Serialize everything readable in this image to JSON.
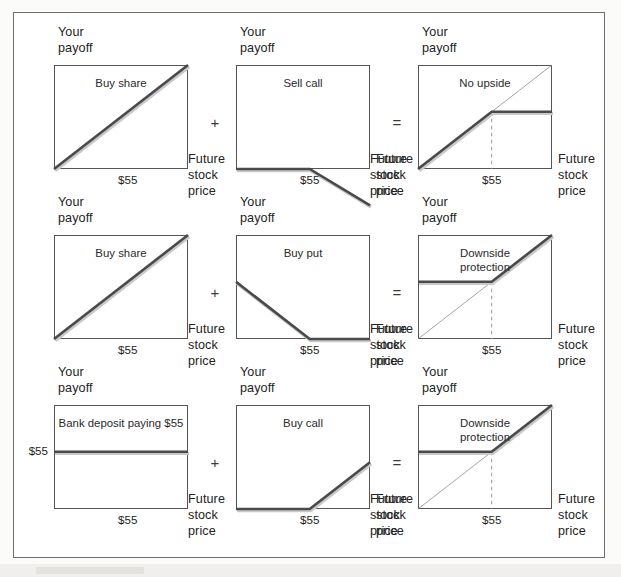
{
  "figure": {
    "strike_label": "$55",
    "y_axis_label": "Your\npayoff",
    "x_axis_label": "Future\nstock\nprice",
    "operator_plus": "+",
    "operator_equals": "="
  },
  "colors": {
    "payoff_line": "#4a4a4a",
    "reference_line": "#8e8e8e",
    "panel_border": "#555555",
    "frame_border": "#6f6f6f",
    "text": "#232323",
    "dashed_guide": "#9a9a9a",
    "page_background": "#fbfbfa",
    "outside_background": "#f2f1ef"
  },
  "chart_data": {
    "type": "line",
    "xlabel": "Future stock price",
    "ylabel": "Your payoff",
    "xlim": [
      0,
      100
    ],
    "ylim": [
      -35,
      100
    ],
    "strike": 55,
    "grid": false,
    "legend": "none",
    "rows": [
      {
        "row_index": 1,
        "operator_1": "+",
        "operator_2": "=",
        "panels": [
          {
            "position": "left",
            "title": "Buy share",
            "series_name": "buy-share",
            "x": [
              0,
              100
            ],
            "y": [
              0,
              100
            ],
            "has_reference_line": false,
            "has_strike_guide": true,
            "y_tick_label": null
          },
          {
            "position": "middle",
            "title": "Sell call",
            "series_name": "sell-call",
            "x": [
              0,
              55,
              100
            ],
            "y": [
              0,
              0,
              -35
            ],
            "has_reference_line": false,
            "has_strike_guide": false,
            "y_tick_label": null
          },
          {
            "position": "right",
            "title": "No upside",
            "series_name": "no-upside",
            "x": [
              0,
              55,
              100
            ],
            "y": [
              0,
              55,
              55
            ],
            "has_reference_line": true,
            "has_strike_guide": true,
            "y_tick_label": null
          }
        ]
      },
      {
        "row_index": 2,
        "operator_1": "+",
        "operator_2": "=",
        "panels": [
          {
            "position": "left",
            "title": "Buy share",
            "series_name": "buy-share",
            "x": [
              0,
              100
            ],
            "y": [
              0,
              100
            ],
            "has_reference_line": false,
            "has_strike_guide": true,
            "y_tick_label": null
          },
          {
            "position": "middle",
            "title": "Buy put",
            "series_name": "buy-put",
            "x": [
              0,
              55,
              100
            ],
            "y": [
              55,
              0,
              0
            ],
            "has_reference_line": false,
            "has_strike_guide": false,
            "y_tick_label": null
          },
          {
            "position": "right",
            "title": "Downside\nprotection",
            "series_name": "downside-protection",
            "x": [
              0,
              55,
              100
            ],
            "y": [
              55,
              55,
              100
            ],
            "has_reference_line": true,
            "has_strike_guide": true,
            "y_tick_label": null
          }
        ]
      },
      {
        "row_index": 3,
        "operator_1": "+",
        "operator_2": "=",
        "panels": [
          {
            "position": "left",
            "title": "Bank deposit paying $55",
            "series_name": "bank-deposit",
            "x": [
              0,
              100
            ],
            "y": [
              55,
              55
            ],
            "has_reference_line": false,
            "has_strike_guide": true,
            "y_tick_label": "$55"
          },
          {
            "position": "middle",
            "title": "Buy call",
            "series_name": "buy-call",
            "x": [
              0,
              55,
              100
            ],
            "y": [
              0,
              0,
              45
            ],
            "has_reference_line": false,
            "has_strike_guide": false,
            "y_tick_label": null
          },
          {
            "position": "right",
            "title": "Downside\nprotection",
            "series_name": "downside-protection",
            "x": [
              0,
              55,
              100
            ],
            "y": [
              55,
              55,
              100
            ],
            "has_reference_line": true,
            "has_strike_guide": true,
            "y_tick_label": null
          }
        ]
      }
    ]
  }
}
